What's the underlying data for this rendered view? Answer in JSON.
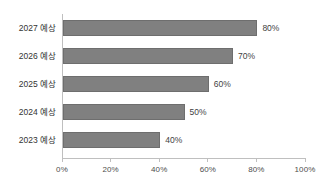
{
  "chart_data": {
    "type": "bar",
    "orientation": "horizontal",
    "title": "",
    "subtitle": "",
    "xlabel": "",
    "ylabel": "",
    "categories": [
      "2023 예상",
      "2024 예상",
      "2025 예상",
      "2026 예상",
      "2027 예상"
    ],
    "values": [
      40,
      50,
      60,
      70,
      80
    ],
    "value_labels": [
      "40%",
      "50%",
      "60%",
      "70%",
      "80%"
    ],
    "xlim": [
      0,
      100
    ],
    "xticks": [
      0,
      20,
      40,
      60,
      80,
      100
    ],
    "xtick_labels": [
      "0%",
      "20%",
      "40%",
      "60%",
      "80%",
      "100%"
    ],
    "grid": false,
    "legend": false,
    "legend_position": "none",
    "series": [
      {
        "name": "",
        "values": [
          40,
          50,
          60,
          70,
          80
        ]
      }
    ],
    "colors": {
      "bar_fill": "#808080",
      "bar_border": "#6e6e6e",
      "axis": "#bfbfbf",
      "tick_label": "#4d4d4d",
      "category_label": "#333333",
      "value_label": "#3f3f3f",
      "background": "#ffffff"
    }
  },
  "rows": [
    {
      "label": "2027 예상",
      "value_label": "80%"
    },
    {
      "label": "2026 예상",
      "value_label": "70%"
    },
    {
      "label": "2025 예상",
      "value_label": "60%"
    },
    {
      "label": "2024 예상",
      "value_label": "50%"
    },
    {
      "label": "2023 예상",
      "value_label": "40%"
    }
  ],
  "xticks": [
    {
      "label": "0%"
    },
    {
      "label": "20%"
    },
    {
      "label": "40%"
    },
    {
      "label": "60%"
    },
    {
      "label": "80%"
    },
    {
      "label": "100%"
    }
  ]
}
